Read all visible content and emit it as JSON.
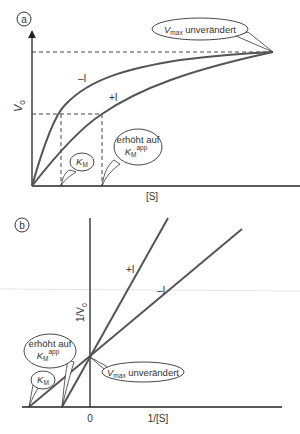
{
  "panel_a": {
    "label": "a",
    "y_axis_label": "V",
    "y_axis_sub": "0",
    "x_axis_label": "[S]",
    "curve_minus_label": "–I",
    "curve_plus_label": "+I",
    "callout_vmax": {
      "main": "V",
      "sub": "max",
      "rest": " unverändert"
    },
    "callout_km": {
      "main": "K",
      "sub": "M"
    },
    "callout_kmapp": {
      "line1": "erhöht auf",
      "main": "K",
      "sub": "M",
      "sup": "app"
    }
  },
  "panel_b": {
    "label": "b",
    "y_axis_label": "1/V",
    "y_axis_sub": "0",
    "x_axis_label": "1/[S]",
    "origin_label": "0",
    "line_plus_label": "+I",
    "line_minus_label": "–I",
    "callout_vmax": {
      "main": "V",
      "sub": "max",
      "rest": " unverändert"
    },
    "callout_km": {
      "main": "K",
      "sub": "M"
    },
    "callout_kmapp": {
      "line1": "erhöht auf",
      "main": "K",
      "sub": "M",
      "sup": "app"
    }
  },
  "colors": {
    "line": "#555555",
    "axis": "#222222",
    "dash": "#444444"
  }
}
